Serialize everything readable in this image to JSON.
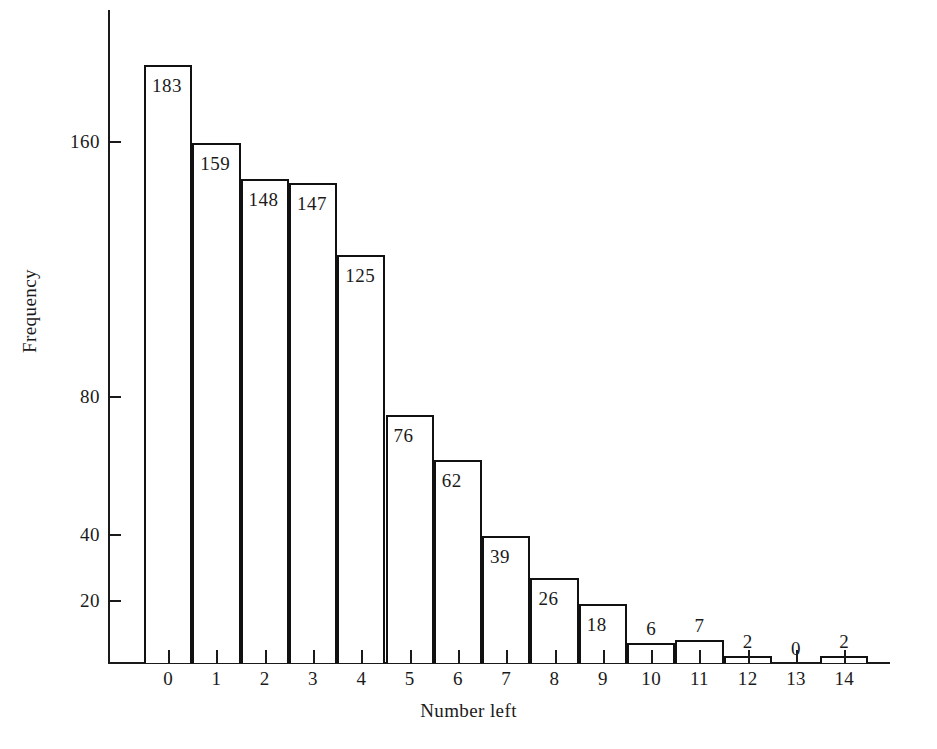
{
  "chart_data": {
    "type": "bar",
    "title": "",
    "xlabel": "Number left",
    "ylabel": "Frequency",
    "categories": [
      "0",
      "1",
      "2",
      "3",
      "4",
      "5",
      "6",
      "7",
      "8",
      "9",
      "10",
      "11",
      "12",
      "13",
      "14"
    ],
    "values": [
      183,
      159,
      148,
      147,
      125,
      76,
      62,
      39,
      26,
      18,
      6,
      7,
      2,
      0,
      2
    ],
    "y_ticks": [
      20,
      40,
      80,
      160
    ],
    "y_tick_labels": [
      "20",
      "40",
      "80",
      "160"
    ],
    "ylim": [
      0,
      200
    ],
    "grid": false,
    "legend": null,
    "bar_labels": [
      "183",
      "159",
      "148",
      "147",
      "125",
      "76",
      "62",
      "39",
      "26",
      "18",
      "6",
      "7",
      "2",
      "0",
      "2"
    ],
    "colors": {
      "bar_fill": "#ffffff",
      "bar_stroke": "#111111",
      "axis": "#1a1a1a",
      "text": "#1a1a1a",
      "background": "#ffffff"
    }
  }
}
